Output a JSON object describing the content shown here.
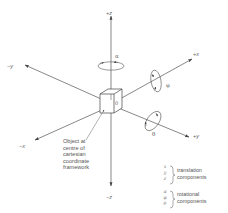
{
  "diagram": {
    "axes": {
      "pos_z": "+z",
      "neg_z": "−z",
      "pos_x": "+x",
      "neg_x": "−x",
      "pos_y": "+y",
      "neg_y": "−y"
    },
    "rotations": {
      "about_z": "α",
      "about_x": "φ",
      "about_y": "θ"
    },
    "origin_label": "0",
    "object_note": [
      "Object at",
      "centre of",
      "cartesian",
      "coordinate",
      "framework"
    ],
    "legend": {
      "translation": {
        "symbols": [
          "x",
          "y",
          "z"
        ],
        "label_line1": "translation",
        "label_line2": "components"
      },
      "rotational": {
        "symbols": [
          "α",
          "φ",
          "θ"
        ],
        "label_line1": "rotational",
        "label_line2": "components"
      }
    },
    "colors": {
      "line": "#555555",
      "text": "#666666",
      "background": "#ffffff"
    }
  }
}
